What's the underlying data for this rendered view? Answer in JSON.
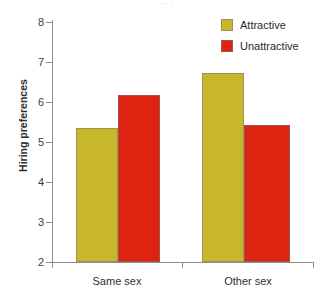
{
  "figure": {
    "title_remnant": "·· ·",
    "background": "#ffffff"
  },
  "legend": {
    "position": "top-right",
    "entries": [
      {
        "label": "Attractive",
        "color": "#c9b72b",
        "swatch_name": "legend-swatch-attractive"
      },
      {
        "label": "Unattractive",
        "color": "#dc2411",
        "swatch_name": "legend-swatch-unattractive"
      }
    ]
  },
  "axes": {
    "y": {
      "label": "Hiring preferences",
      "ticks": [
        "8",
        "7",
        "6",
        "5",
        "4",
        "3",
        "2"
      ],
      "min": 2,
      "max": 8
    },
    "x": {
      "label": "",
      "ticks": [
        "Same sex",
        "Other sex"
      ]
    }
  },
  "chart_data": {
    "type": "bar",
    "title": "",
    "subtitle": "",
    "xlabel": "",
    "ylabel": "Hiring preferences",
    "categories": [
      "Same sex",
      "Other sex"
    ],
    "series": [
      {
        "name": "Attractive",
        "color": "#c9b72b",
        "values": [
          5.35,
          6.73
        ]
      },
      {
        "name": "Unattractive",
        "color": "#dc2411",
        "values": [
          6.18,
          5.43
        ]
      }
    ],
    "ylim": [
      2,
      8
    ],
    "ytick_values": [
      2,
      3,
      4,
      5,
      6,
      7,
      8
    ],
    "grid": false,
    "legend_position": "top-right",
    "bar_border_color": "#8d8d8d"
  }
}
